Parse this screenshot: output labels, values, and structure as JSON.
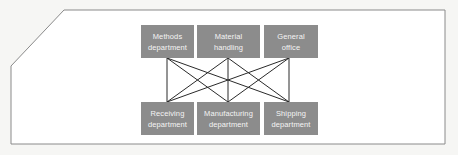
{
  "diagram": {
    "type": "network",
    "colors": {
      "box_fill": "#8c8c8c",
      "box_text": "#f4f4f4",
      "line": "#2a2a2a",
      "frame": "#8a8a8a",
      "background": "#f6f6f4"
    },
    "top_nodes": [
      {
        "id": "methods",
        "line1": "Methods",
        "line2": "department"
      },
      {
        "id": "material",
        "line1": "Material",
        "line2": "handling"
      },
      {
        "id": "general",
        "line1": "General",
        "line2": "office"
      }
    ],
    "bottom_nodes": [
      {
        "id": "receiving",
        "line1": "Receiving",
        "line2": "department"
      },
      {
        "id": "manufacturing",
        "line1": "Manufacturing",
        "line2": "department"
      },
      {
        "id": "shipping",
        "line1": "Shipping",
        "line2": "department"
      }
    ],
    "edges": [
      [
        "methods",
        "receiving"
      ],
      [
        "methods",
        "manufacturing"
      ],
      [
        "methods",
        "shipping"
      ],
      [
        "material",
        "receiving"
      ],
      [
        "material",
        "manufacturing"
      ],
      [
        "material",
        "shipping"
      ],
      [
        "general",
        "receiving"
      ],
      [
        "general",
        "manufacturing"
      ],
      [
        "general",
        "shipping"
      ]
    ]
  }
}
